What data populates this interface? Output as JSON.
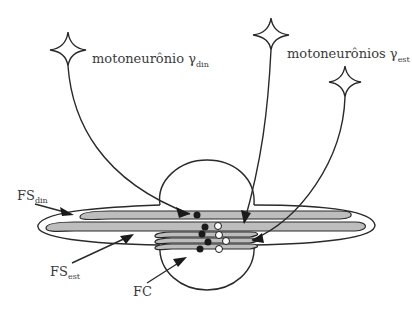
{
  "diagram": {
    "labels": {
      "gamma_din": {
        "text": "motoneurônio γ",
        "subscript": "din"
      },
      "gamma_est": {
        "text": "motoneurônios γ",
        "subscript": "est"
      },
      "fs_din": {
        "text": "FS",
        "subscript": "din"
      },
      "fs_est": {
        "text": "FS",
        "subscript": "est"
      },
      "fc": {
        "text": "FC"
      }
    },
    "neurons": [
      {
        "id": "gamma-din",
        "label": "motoneurônio γdin"
      },
      {
        "id": "gamma-est-1",
        "label": "motoneurônios γest"
      },
      {
        "id": "gamma-est-2",
        "label": "motoneurônios γest"
      }
    ],
    "colors": {
      "line": "#2a2a2a",
      "fiber_fill": "#bdbdbd",
      "text": "#3a3a3a",
      "background": "#ffffff"
    }
  }
}
